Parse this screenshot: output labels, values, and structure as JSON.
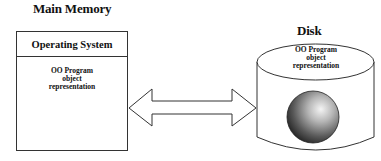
{
  "main_memory": {
    "title": "Main Memory",
    "header": "Operating System",
    "object_label": [
      "OO Program",
      "object",
      "representation"
    ]
  },
  "disk": {
    "title": "Disk",
    "object_label": [
      "OO Program",
      "object",
      "representation"
    ]
  },
  "connector": {
    "type": "double-headed-arrow",
    "between": [
      "Main Memory",
      "Disk"
    ]
  }
}
